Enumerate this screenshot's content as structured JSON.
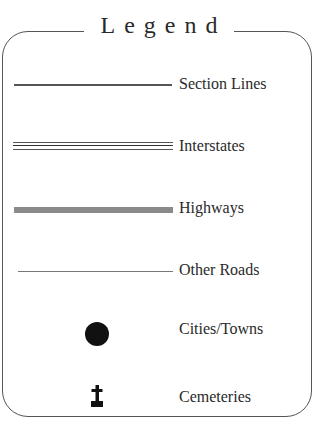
{
  "legend": {
    "title": "Legend",
    "items": [
      {
        "label": "Section Lines",
        "symbol": "thin-line"
      },
      {
        "label": "Interstates",
        "symbol": "triple-line"
      },
      {
        "label": "Highways",
        "symbol": "thick-gray-line"
      },
      {
        "label": "Other Roads",
        "symbol": "hairline"
      },
      {
        "label": "Cities/Towns",
        "symbol": "filled-circle"
      },
      {
        "label": "Cemeteries",
        "symbol": "grave-cross-icon"
      }
    ],
    "colors": {
      "frame": "#555555",
      "text": "#2a2a2a",
      "highway": "#8a8a8a",
      "city": "#111111"
    }
  }
}
